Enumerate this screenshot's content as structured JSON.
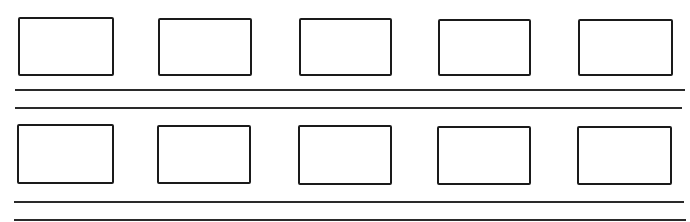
{
  "worksheet": {
    "rows": [
      {
        "boxes": 5,
        "writing_lines": 2
      },
      {
        "boxes": 5,
        "writing_lines": 2
      }
    ],
    "colors": {
      "ink": "#1a1a1a",
      "paper": "#ffffff"
    }
  }
}
